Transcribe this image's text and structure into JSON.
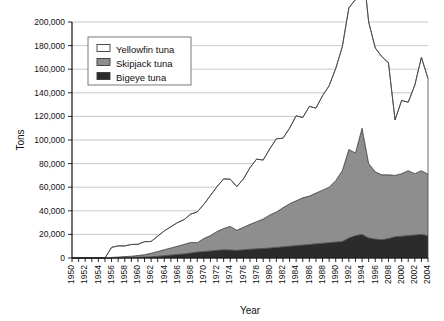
{
  "chart_data": {
    "type": "area",
    "stacked": true,
    "title": "",
    "xlabel": "Year",
    "ylabel": "Tons",
    "xlim": [
      1950,
      2004
    ],
    "ylim": [
      0,
      200000
    ],
    "ytick_step": 20000,
    "grid": "horizontal",
    "legend_position": "top-left-inside",
    "ytick_labels": [
      "0",
      "20,000",
      "40,000",
      "60,000",
      "80,000",
      "100,000",
      "120,000",
      "140,000",
      "160,000",
      "180,000",
      "200,000"
    ],
    "ytick_values": [
      0,
      20000,
      40000,
      60000,
      80000,
      100000,
      120000,
      140000,
      160000,
      180000,
      200000
    ],
    "xtick_labels": [
      "1950",
      "1952",
      "1954",
      "1956",
      "1958",
      "1960",
      "1962",
      "1964",
      "1966",
      "1968",
      "1970",
      "1972",
      "1974",
      "1976",
      "1978",
      "1980",
      "1982",
      "1984",
      "1986",
      "1988",
      "1990",
      "1992",
      "1994",
      "1996",
      "2098",
      "2000",
      "2002",
      "2004"
    ],
    "xtick_label_rotation": -90,
    "x": [
      1950,
      1951,
      1952,
      1953,
      1954,
      1955,
      1956,
      1957,
      1958,
      1959,
      1960,
      1961,
      1962,
      1963,
      1964,
      1965,
      1966,
      1967,
      1968,
      1969,
      1970,
      1971,
      1972,
      1973,
      1974,
      1975,
      1976,
      1977,
      1978,
      1979,
      1980,
      1981,
      1982,
      1983,
      1984,
      1985,
      1986,
      1987,
      1988,
      1989,
      1990,
      1991,
      1992,
      1993,
      1994,
      1995,
      1996,
      1997,
      1998,
      1999,
      2000,
      2001,
      2002,
      2003,
      2004
    ],
    "series": [
      {
        "name": "Bigeye tuna",
        "color": "#2b2b2b",
        "values": [
          0,
          0,
          0,
          0,
          0,
          0,
          200,
          300,
          400,
          500,
          600,
          800,
          1000,
          1500,
          2000,
          2500,
          3000,
          3500,
          4200,
          5000,
          5500,
          6000,
          6500,
          7000,
          6800,
          6500,
          7000,
          7500,
          7800,
          8000,
          8500,
          9000,
          9500,
          10000,
          10500,
          11000,
          11500,
          12000,
          12500,
          13000,
          13500,
          14000,
          17000,
          19000,
          20000,
          17000,
          16000,
          15500,
          16500,
          18000,
          18500,
          19000,
          19500,
          20000,
          19000
        ]
      },
      {
        "name": "Skipjack tuna",
        "color": "#8e8e8e",
        "values": [
          0,
          0,
          0,
          0,
          0,
          0,
          300,
          500,
          800,
          1000,
          1500,
          2000,
          3000,
          4000,
          5000,
          6000,
          7000,
          8000,
          9000,
          8000,
          11000,
          13000,
          16000,
          18000,
          20000,
          17000,
          19000,
          21000,
          23000,
          25000,
          28000,
          30000,
          33000,
          36000,
          38000,
          40000,
          41000,
          43000,
          45000,
          47000,
          52000,
          60000,
          75000,
          70000,
          90000,
          63000,
          57000,
          55000,
          54000,
          52000,
          53000,
          55000,
          52000,
          54000,
          52000
        ]
      },
      {
        "name": "Yellowfin tuna",
        "color": "#ffffff",
        "values": [
          0,
          0,
          0,
          0,
          0,
          0,
          8500,
          9500,
          9000,
          10000,
          9500,
          11000,
          10000,
          13000,
          16000,
          18000,
          20000,
          21000,
          24000,
          26000,
          29000,
          34000,
          38000,
          42000,
          40000,
          37000,
          41000,
          48000,
          53000,
          50000,
          56000,
          62000,
          59000,
          64000,
          72000,
          68000,
          76000,
          72000,
          80000,
          86000,
          95000,
          105000,
          120000,
          130000,
          143000,
          120000,
          105000,
          100000,
          95000,
          47000,
          62000,
          58000,
          75000,
          96000,
          81000
        ]
      }
    ],
    "stack_totals_note": "Top outline of stack reaches about 183,000 at 1994 and about 170,000 at 2003"
  },
  "legend": {
    "items": [
      {
        "label": "Yellowfin tuna",
        "swatch": "#ffffff"
      },
      {
        "label": "Skipjack tuna",
        "swatch": "#8e8e8e"
      },
      {
        "label": "Bigeye tuna",
        "swatch": "#2b2b2b"
      }
    ]
  },
  "axes": {
    "y_title": "Tons",
    "x_title": "Year"
  }
}
